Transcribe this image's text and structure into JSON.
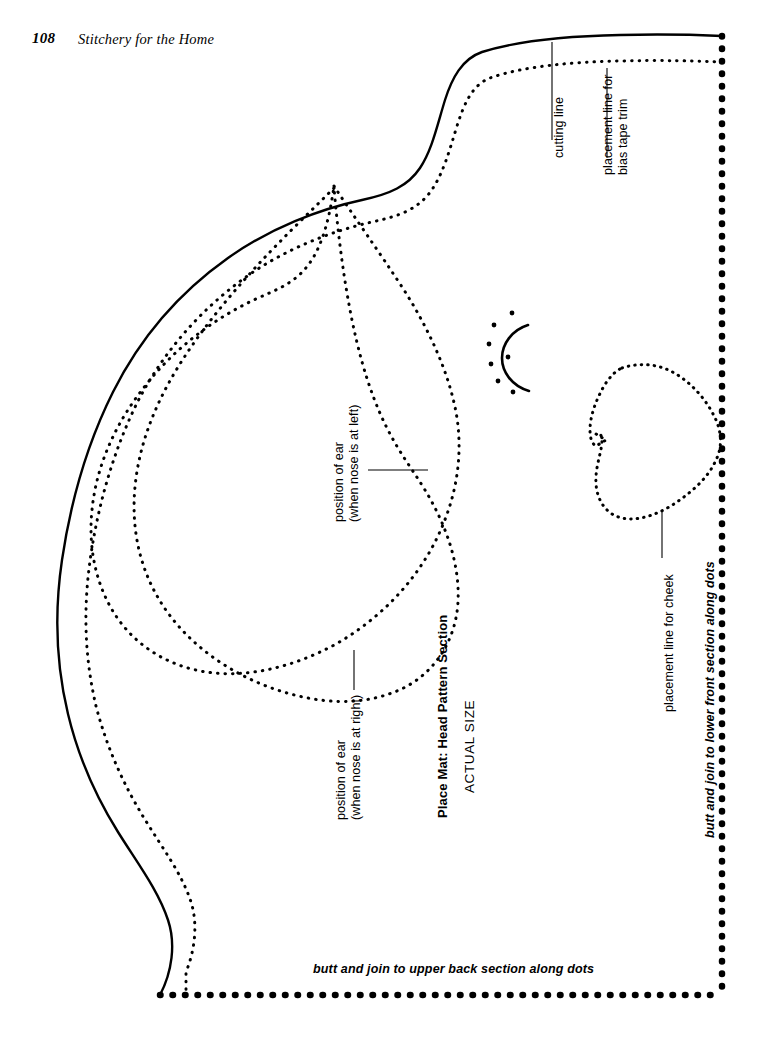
{
  "running_head": {
    "page_number": "108",
    "book_title": "Stitchery for the Home"
  },
  "figure": {
    "title": "Place Mat: Head Pattern Section",
    "subtitle": "ACTUAL SIZE"
  },
  "annotations": {
    "cutting_line": "cutting line",
    "bias_tape_line1": "placement line for",
    "bias_tape_line2": "bias tape trim",
    "ear_left_line1": "position of ear",
    "ear_left_line2": "(when nose is at left)",
    "ear_right_line1": "position of ear",
    "ear_right_line2": "(when nose is at right)",
    "cheek_line": "placement line for cheek",
    "join_lower_front": "butt and join to lower front section along dots",
    "join_upper_back": "butt and join to upper back section along dots"
  },
  "colors": {
    "ink": "#000000",
    "paper": "#ffffff"
  }
}
